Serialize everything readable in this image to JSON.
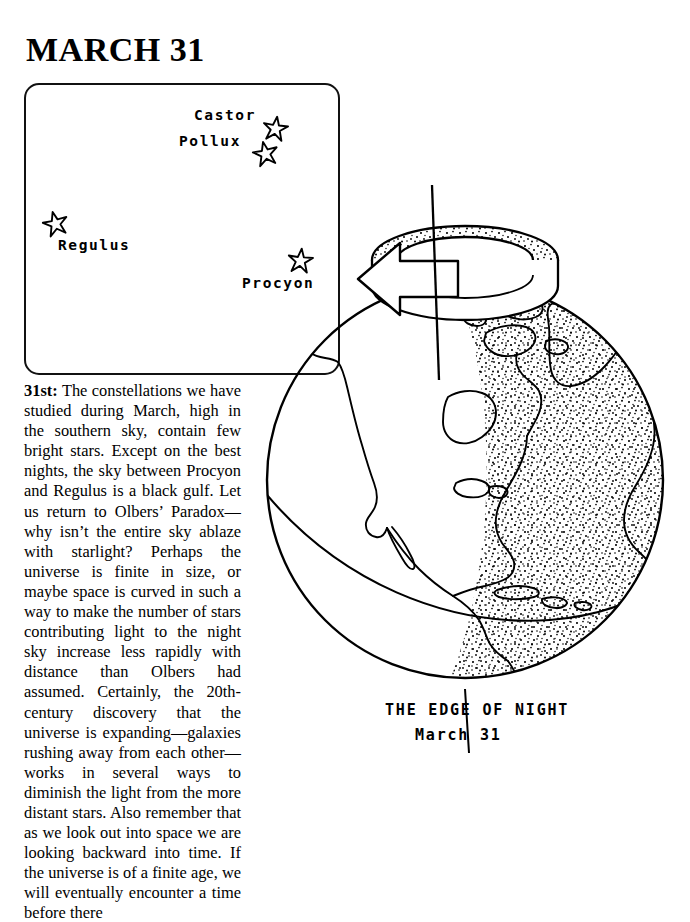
{
  "page": {
    "title": "MARCH 31",
    "background_color": "#ffffff",
    "ink_color": "#000000"
  },
  "star_chart": {
    "name": "march-31-star-chart",
    "border_color": "#111111",
    "stars": [
      {
        "label": "Castor",
        "icon": "star-icon",
        "label_x": 168,
        "label_y": 28,
        "star_x": 236,
        "star_y": 30,
        "star_size": 27
      },
      {
        "label": "Pollux",
        "icon": "star-icon",
        "label_x": 153,
        "label_y": 54,
        "star_x": 226,
        "star_y": 55,
        "star_size": 27
      },
      {
        "label": "Regulus",
        "icon": "star-icon",
        "label_x": 32,
        "label_y": 158,
        "star_x": 16,
        "star_y": 125,
        "star_size": 27
      },
      {
        "label": "Procyon",
        "icon": "star-icon",
        "label_x": 216,
        "label_y": 196,
        "star_x": 261,
        "star_y": 162,
        "star_size": 27
      }
    ]
  },
  "article": {
    "lead_in": "31st:",
    "body": " The constellations we have studied during March, high in the southern sky, contain few bright stars. Except on the best nights, the sky between Procyon and Regulus is a black gulf. Let us return to Olbers’ Paradox—why isn’t the entire sky ablaze with starlight? Perhaps the universe is finite in size, or maybe space is curved in such a way to make the number of stars contributing light to the night sky increase less rapidly with distance than Olbers had assumed. Certainly, the 20th-century discovery that the universe is expanding—galaxies rushing away from each other—works in several ways to diminish the light from the more distant stars. Also remember that as we look out into space we are looking backward into time. If the universe is of a finite age, we will eventually encounter a time before there"
  },
  "globe": {
    "name": "edge-of-night-globe",
    "caption_title": "THE EDGE OF NIGHT",
    "caption_date": "March 31",
    "features": {
      "rotation_arrow": "rotation-arrow-icon",
      "axis": "rotation-axis-line",
      "terminator": "day-night-terminator-line",
      "equator": "equator-arc-line",
      "night_side": "stippled-night-hemisphere",
      "landmass": "north-america-outline",
      "pointer": "caption-pointer-line"
    }
  }
}
